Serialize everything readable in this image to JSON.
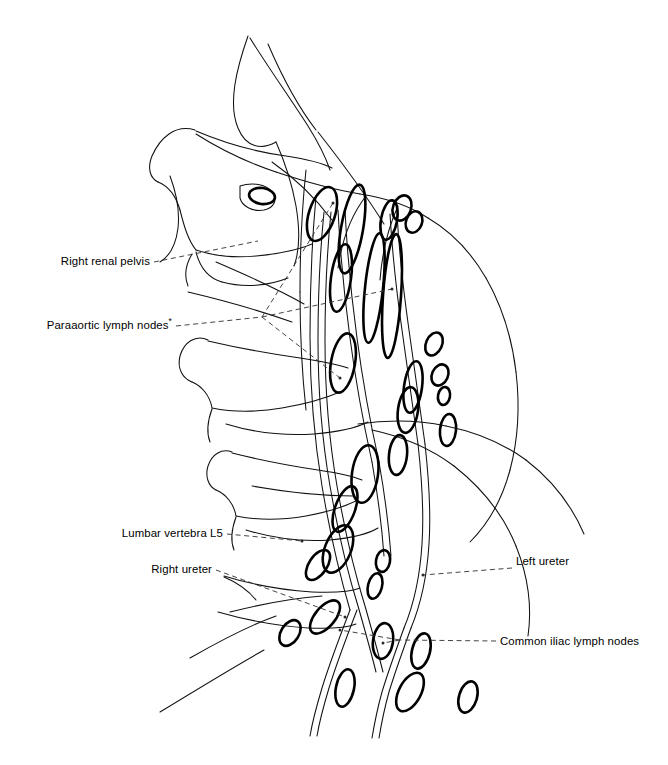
{
  "figure": {
    "background_color": "#ffffff",
    "line_color": "#111111",
    "node_outline_color": "#000000",
    "leader_color": "#3a3a3a",
    "width": 668,
    "height": 765
  },
  "labels": [
    {
      "id": "right-renal-pelvis",
      "text": "Right renal pelvis",
      "asterisk": "",
      "text_x": 150,
      "text_y": 265,
      "anchor": "end",
      "leaders": [
        {
          "points": "154,262 258,241",
          "dot": ""
        }
      ]
    },
    {
      "id": "paraaortic-lymph-nodes",
      "text": "Paraaortic lymph nodes",
      "asterisk": "*",
      "text_x": 172,
      "text_y": 329,
      "anchor": "end",
      "leaders": [
        {
          "points": "176,326 262,317",
          "dot": ""
        },
        {
          "points": "262,317 333,203",
          "dot": "333,203"
        },
        {
          "points": "262,317 392,289",
          "dot": "392,289"
        },
        {
          "points": "262,317 340,378",
          "dot": "340,378"
        }
      ]
    },
    {
      "id": "lumbar-vertebra-l5",
      "text": "Lumbar vertebra L5",
      "asterisk": "",
      "text_x": 223,
      "text_y": 537,
      "anchor": "end",
      "leaders": [
        {
          "points": "227,534 302,541",
          "dot": "302,541"
        }
      ]
    },
    {
      "id": "right-ureter",
      "text": "Right ureter",
      "asterisk": "",
      "text_x": 212,
      "text_y": 573,
      "anchor": "end",
      "leaders": [
        {
          "points": "216,570 345,617",
          "dot": "345,617"
        }
      ]
    },
    {
      "id": "left-ureter",
      "text": "Left ureter",
      "asterisk": "",
      "text_x": 516,
      "text_y": 565,
      "anchor": "start",
      "leaders": [
        {
          "points": "512,568 423,575",
          "dot": "423,575"
        }
      ]
    },
    {
      "id": "common-iliac-lymph-nodes",
      "text": "Common iliac lymph nodes",
      "asterisk": "",
      "text_x": 500,
      "text_y": 645,
      "anchor": "start",
      "leaders": [
        {
          "points": "496,641 400,640",
          "dot": ""
        },
        {
          "points": "400,640 383,643",
          "dot": "383,643"
        },
        {
          "points": "400,640 340,630",
          "dot": "340,630"
        }
      ]
    }
  ],
  "lymph_nodes": [
    {
      "id": "node-1",
      "cx": 322,
      "cy": 214,
      "rx": 13,
      "ry": 28,
      "rot": 18,
      "weight": "thick"
    },
    {
      "id": "node-2",
      "cx": 352,
      "cy": 229,
      "rx": 11,
      "ry": 45,
      "rot": 10,
      "weight": "thick"
    },
    {
      "id": "node-3",
      "cx": 341,
      "cy": 278,
      "rx": 10,
      "ry": 34,
      "rot": 8,
      "weight": "thick"
    },
    {
      "id": "node-4",
      "cx": 374,
      "cy": 288,
      "rx": 9,
      "ry": 55,
      "rot": 6,
      "weight": "thick"
    },
    {
      "id": "node-5",
      "cx": 392,
      "cy": 296,
      "rx": 9,
      "ry": 62,
      "rot": 4,
      "weight": "thick"
    },
    {
      "id": "node-6",
      "cx": 402,
      "cy": 208,
      "rx": 9,
      "ry": 13,
      "rot": 20,
      "weight": "thick"
    },
    {
      "id": "node-7",
      "cx": 414,
      "cy": 222,
      "rx": 8,
      "ry": 11,
      "rot": 20,
      "weight": "thick"
    },
    {
      "id": "node-8",
      "cx": 343,
      "cy": 363,
      "rx": 12,
      "ry": 30,
      "rot": 10,
      "weight": "thick"
    },
    {
      "id": "node-9",
      "cx": 413,
      "cy": 387,
      "rx": 9,
      "ry": 26,
      "rot": 8,
      "weight": "thick"
    },
    {
      "id": "node-10",
      "cx": 434,
      "cy": 344,
      "rx": 8,
      "ry": 12,
      "rot": 24,
      "weight": "thick"
    },
    {
      "id": "node-11",
      "cx": 440,
      "cy": 375,
      "rx": 8,
      "ry": 11,
      "rot": 24,
      "weight": "thick"
    },
    {
      "id": "node-12",
      "cx": 444,
      "cy": 396,
      "rx": 6,
      "ry": 9,
      "rot": 10,
      "weight": "thick"
    },
    {
      "id": "node-13",
      "cx": 408,
      "cy": 410,
      "rx": 10,
      "ry": 23,
      "rot": 8,
      "weight": "thick"
    },
    {
      "id": "node-14",
      "cx": 448,
      "cy": 430,
      "rx": 8,
      "ry": 16,
      "rot": 6,
      "weight": "thick"
    },
    {
      "id": "node-15",
      "cx": 365,
      "cy": 474,
      "rx": 13,
      "ry": 29,
      "rot": 8,
      "weight": "thick"
    },
    {
      "id": "node-16",
      "cx": 398,
      "cy": 455,
      "rx": 9,
      "ry": 20,
      "rot": 6,
      "weight": "thick"
    },
    {
      "id": "node-17",
      "cx": 338,
      "cy": 549,
      "rx": 13,
      "ry": 25,
      "rot": 22,
      "weight": "thick"
    },
    {
      "id": "node-18",
      "cx": 345,
      "cy": 509,
      "rx": 10,
      "ry": 24,
      "rot": 20,
      "weight": "thick"
    },
    {
      "id": "node-19",
      "cx": 318,
      "cy": 565,
      "rx": 9,
      "ry": 17,
      "rot": 34,
      "weight": "thick"
    },
    {
      "id": "node-20",
      "cx": 383,
      "cy": 561,
      "rx": 7,
      "ry": 11,
      "rot": 10,
      "weight": "thick"
    },
    {
      "id": "node-21",
      "cx": 375,
      "cy": 586,
      "rx": 7,
      "ry": 13,
      "rot": 14,
      "weight": "thick"
    },
    {
      "id": "node-22",
      "cx": 325,
      "cy": 617,
      "rx": 10,
      "ry": 20,
      "rot": 40,
      "weight": "thick"
    },
    {
      "id": "node-23",
      "cx": 290,
      "cy": 633,
      "rx": 9,
      "ry": 14,
      "rot": 32,
      "weight": "thick"
    },
    {
      "id": "node-24",
      "cx": 383,
      "cy": 641,
      "rx": 10,
      "ry": 18,
      "rot": 8,
      "weight": "thick"
    },
    {
      "id": "node-25",
      "cx": 421,
      "cy": 651,
      "rx": 9,
      "ry": 18,
      "rot": 14,
      "weight": "thick"
    },
    {
      "id": "node-26",
      "cx": 345,
      "cy": 688,
      "rx": 9,
      "ry": 19,
      "rot": 12,
      "weight": "thick"
    },
    {
      "id": "node-27",
      "cx": 410,
      "cy": 692,
      "rx": 11,
      "ry": 21,
      "rot": 28,
      "weight": "thick"
    },
    {
      "id": "node-28",
      "cx": 468,
      "cy": 697,
      "rx": 9,
      "ry": 16,
      "rot": 16,
      "weight": "thick"
    },
    {
      "id": "node-29",
      "cx": 389,
      "cy": 220,
      "rx": 8,
      "ry": 20,
      "rot": 10,
      "weight": "thick"
    },
    {
      "id": "node-30",
      "cx": 262,
      "cy": 196,
      "rx": 13,
      "ry": 8,
      "rot": 8,
      "weight": "thick"
    }
  ],
  "bone_outlines": [
    "M 248 36 C 236 70, 228 104, 238 128 C 246 148, 262 150, 276 142",
    "M 250 38 C 266 64, 290 98, 308 126 C 318 142, 326 158, 330 170",
    "M 195 130 C 175 124, 160 138, 152 156 C 147 168, 150 178, 158 182",
    "M 196 131 C 222 142, 256 152, 286 156 C 306 159, 320 162, 332 168",
    "M 158 182 C 168 186, 176 196, 180 210",
    "M 180 210 C 184 226, 188 240, 196 250",
    "M 170 176 C 176 192, 180 210, 178 228 C 176 244, 170 256, 160 262",
    "M 196 250 C 214 256, 236 258, 256 256 C 278 254, 298 250, 312 244",
    "M 196 252 C 200 268, 208 278, 222 282",
    "M 222 282 C 244 288, 268 286, 288 278",
    "M 192 254 C 186 264, 184 276, 188 286",
    "M 276 142 C 284 160, 292 184, 296 206 C 300 230, 300 250, 294 266",
    "M 240 186 C 252 182, 266 184, 272 192 C 278 200, 274 208, 264 210 C 252 212, 242 206, 240 198 Z",
    "M 208 340 C 196 334, 184 342, 180 356 C 177 368, 182 378, 192 382",
    "M 208 341 C 238 348, 272 354, 300 358 C 320 361, 336 364, 348 368",
    "M 192 382 C 202 386, 210 396, 212 408",
    "M 212 408 C 232 412, 258 412, 282 408 C 306 404, 326 398, 340 392",
    "M 226 424 C 252 432, 284 436, 314 434 C 338 432, 356 428, 368 422",
    "M 212 409 C 208 420, 206 432, 210 442",
    "M 232 452 C 222 448, 212 454, 208 466 C 205 476, 208 486, 216 490",
    "M 232 453 C 260 460, 292 466, 318 470 C 338 473, 352 476, 362 480",
    "M 216 490 C 226 494, 234 504, 236 516",
    "M 236 516 C 256 520, 282 520, 306 516 C 328 512, 346 506, 358 500",
    "M 246 530 C 272 538, 302 542, 330 540 C 352 538, 368 534, 378 528",
    "M 236 517 C 232 528, 230 540, 234 550",
    "M 224 576 C 250 584, 282 590, 312 592 C 334 593, 350 592, 360 588",
    "M 224 577 C 236 582, 248 590, 256 600",
    "M 218 612 C 246 620, 278 626, 308 628 C 330 629, 346 628, 356 624",
    "M 190 658 C 218 642, 248 626, 276 616",
    "M 160 712 C 196 690, 232 668, 264 650",
    "M 268 44 C 280 72, 296 104, 316 130",
    "M 318 132 C 340 160, 364 192, 384 224",
    "M 196 134 C 218 148, 246 162, 276 172",
    "M 276 172 C 306 182, 336 190, 360 194",
    "M 360 194 C 386 198, 410 206, 428 218",
    "M 428 218 C 452 232, 472 254, 486 278",
    "M 486 278 C 502 306, 512 338, 516 372",
    "M 516 372 C 520 406, 518 440, 510 470",
    "M 510 470 C 502 500, 488 524, 470 542",
    "M 372 430 C 400 436, 430 448, 454 466",
    "M 454 466 C 482 488, 504 516, 516 546",
    "M 516 546 C 528 576, 532 608, 528 636",
    "M 358 424 C 386 420, 418 420, 446 426",
    "M 446 426 C 476 432, 504 444, 526 460",
    "M 526 460 C 552 480, 572 506, 584 534"
  ],
  "vessel_outlines": [
    "M 324 212 C 320 252, 318 296, 318 340 C 318 390, 322 440, 330 486 C 338 532, 348 574, 358 606 C 366 634, 372 656, 376 672",
    "M 331 212 C 327 252, 325 296, 325 340 C 325 390, 329 440, 337 486 C 345 532, 355 574, 365 606 C 373 634, 379 656, 383 672",
    "M 316 196 C 312 240, 310 288, 310 336 C 310 388, 314 438, 322 486 C 330 534, 340 576, 350 610",
    "M 350 610 C 340 636, 330 662, 322 688 C 316 708, 312 724, 310 736",
    "M 357 610 C 347 636, 337 662, 329 688 C 323 708, 319 724, 317 736",
    "M 390 214 C 392 248, 396 288, 402 330 C 408 374, 414 414, 418 444",
    "M 397 214 C 399 248, 403 288, 409 330 C 415 374, 421 414, 425 444",
    "M 418 444 C 422 480, 424 514, 422 544 C 420 576, 414 604, 404 628",
    "M 425 444 C 429 480, 431 514, 429 544 C 427 576, 421 604, 411 628",
    "M 404 628 C 396 650, 388 672, 382 692 C 377 710, 374 726, 372 738",
    "M 411 628 C 403 650, 395 672, 389 692 C 384 710, 381 726, 379 738",
    "M 338 210 C 340 250, 344 294, 350 338 C 356 384, 364 426, 372 462",
    "M 345 210 C 347 250, 351 294, 357 338 C 363 384, 371 426, 379 462",
    "M 372 462 C 378 496, 382 528, 384 556",
    "M 379 462 C 385 496, 389 528, 391 556",
    "M 306 170 C 302 208, 300 250, 300 292",
    "M 300 292 C 300 334, 302 374, 306 410"
  ],
  "thin_detail_lines": [
    "M 366 196 C 352 214, 342 240, 338 268",
    "M 398 206 C 388 228, 382 254, 380 280",
    "M 272 162 C 292 176, 314 196, 332 220",
    "M 216 262 C 244 274, 276 288, 304 304",
    "M 188 292 C 222 300, 258 310, 292 322",
    "M 252 486 C 286 492, 322 496, 354 496",
    "M 230 612 C 262 604, 294 598, 322 596"
  ]
}
